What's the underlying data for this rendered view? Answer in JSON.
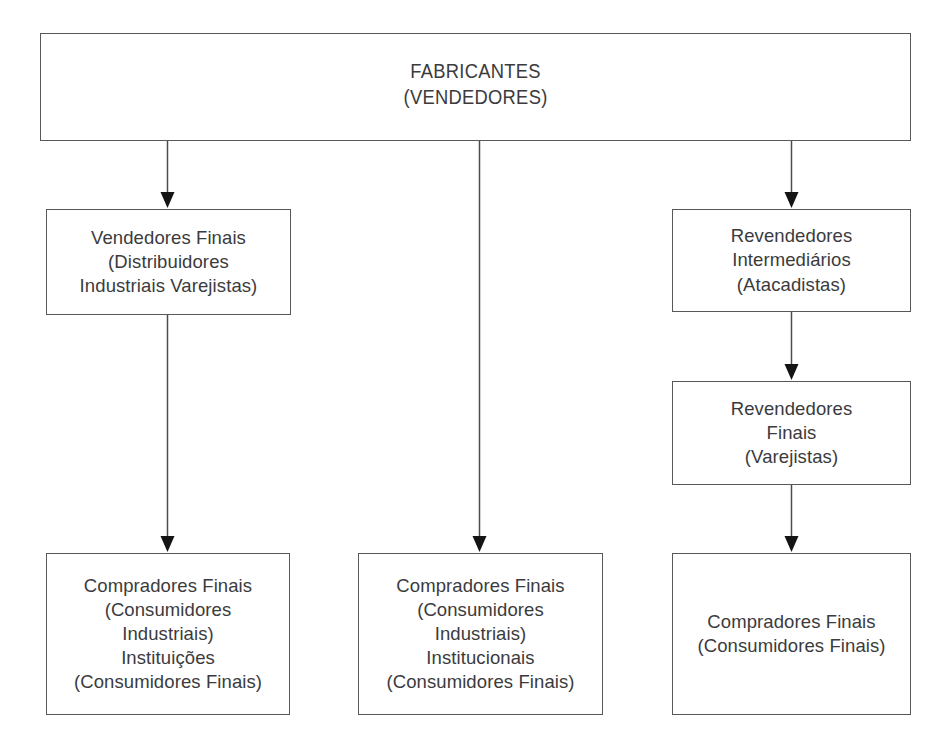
{
  "diagram": {
    "background_color": "#ffffff",
    "box_border_color": "#58585a",
    "text_color": "#3b3b3d",
    "connector_color": "#4c4c4e",
    "nodes": {
      "root": {
        "id": "fabricantes",
        "text": "FABRICANTES\n(VENDEDORES)"
      },
      "left_1": {
        "id": "vendedores-finais",
        "text": "Vendedores Finais\n(Distribuidores\nIndustriais Varejistas)"
      },
      "left_2": {
        "id": "compradores-finais-esquerda",
        "text": "Compradores Finais\n(Consumidores\nIndustriais)\nInstituições\n(Consumidores Finais)"
      },
      "middle_1": {
        "id": "compradores-finais-centro",
        "text": "Compradores Finais\n(Consumidores\nIndustriais)\nInstitucionais\n(Consumidores Finais)"
      },
      "right_1": {
        "id": "revendedores-intermediarios",
        "text": "Revendedores\nIntermediários\n(Atacadistas)"
      },
      "right_2": {
        "id": "revendedores-finais",
        "text": "Revendedores\nFinais\n(Varejistas)"
      },
      "right_3": {
        "id": "compradores-finais-direita",
        "text": "Compradores Finais\n(Consumidores Finais)"
      }
    },
    "edges": [
      {
        "id": "root-to-left-1",
        "from": "fabricantes",
        "to": "vendedores-finais",
        "arrow": "down"
      },
      {
        "id": "root-to-middle-1",
        "from": "fabricantes",
        "to": "compradores-finais-centro",
        "arrow": "down"
      },
      {
        "id": "root-to-right-1",
        "from": "fabricantes",
        "to": "revendedores-intermediarios",
        "arrow": "down"
      },
      {
        "id": "left-1-to-left-2",
        "from": "vendedores-finais",
        "to": "compradores-finais-esquerda",
        "arrow": "down"
      },
      {
        "id": "right-1-to-right-2",
        "from": "revendedores-intermediarios",
        "to": "revendedores-finais",
        "arrow": "down"
      },
      {
        "id": "right-2-to-right-3",
        "from": "revendedores-finais",
        "to": "compradores-finais-direita",
        "arrow": "down"
      }
    ]
  }
}
